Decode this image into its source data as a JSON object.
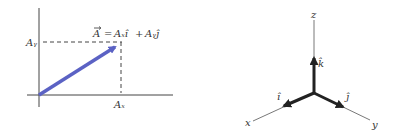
{
  "left_diagram": {
    "vector_label": "A = Aₓî + Aᵧĵ",
    "vector_name": "A",
    "eq_rhs_x": "Aₓî",
    "plus": "+",
    "eq_rhs_y": "Aᵧĵ",
    "axis_x_label": "Aₓ",
    "axis_y_label": "Aᵧ",
    "vector_color": "#5b62c4"
  },
  "right_diagram": {
    "axis_z": "z",
    "axis_x": "x",
    "axis_y": "y",
    "unit_i": "î",
    "unit_j": "ĵ",
    "unit_k": "k̂"
  }
}
